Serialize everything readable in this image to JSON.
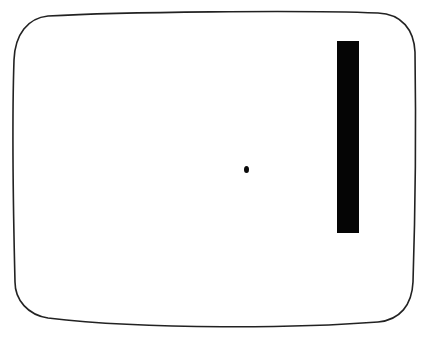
{
  "game": {
    "title": "Pong",
    "screen": {
      "shape": "rounded-crt-outline",
      "background": "#ffffff",
      "outline_color": "#222222"
    },
    "paddle": {
      "side": "right",
      "color": "#050505",
      "x": 337,
      "y": 41,
      "width": 22,
      "height": 192
    },
    "ball": {
      "color": "#0a0a0a",
      "x": 246,
      "y": 170
    }
  }
}
